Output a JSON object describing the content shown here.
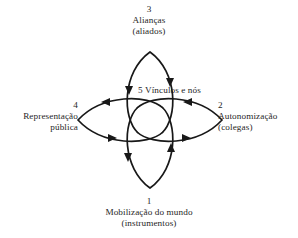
{
  "diagram": {
    "title_center": "5 Vínculos e nós",
    "stroke_color": "#181818",
    "background_color": "#ffffff",
    "nodes": [
      {
        "id": "bottom",
        "number": "1",
        "line1": "Mobilização do mundo",
        "line2": "(instrumentos)",
        "position": "bottom"
      },
      {
        "id": "right",
        "number": "2",
        "line1": "Autonomização",
        "line2": "(colegas)",
        "position": "right"
      },
      {
        "id": "top",
        "number": "3",
        "line1": "Alianças",
        "line2": "(aliados)",
        "position": "top"
      },
      {
        "id": "left",
        "number": "4",
        "line1": "Representação",
        "line2": "pública",
        "position": "left"
      },
      {
        "id": "center",
        "number": "5",
        "line1": "Vínculos e nós",
        "line2": "",
        "position": "center"
      }
    ]
  }
}
